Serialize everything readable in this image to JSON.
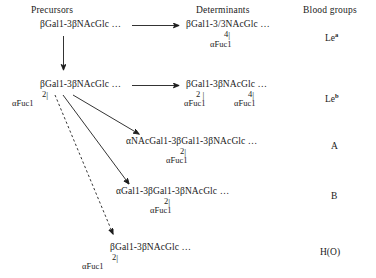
{
  "headers": {
    "precursors": "Precursors",
    "determinants": "Determinants",
    "blood_groups": "Blood groups"
  },
  "precursors": [
    {
      "id": "precursor-type1",
      "structure": "βGal1-3βNAcGlc …",
      "branches": []
    },
    {
      "id": "precursor-fucosylated",
      "structure": "βGal1-3βNAcGlc …",
      "branches": [
        {
          "bond": "2",
          "residue": "αFuc1"
        }
      ]
    }
  ],
  "determinants": [
    {
      "id": "determinant-lewis-a",
      "structure": "βGal1-3/3NAcGlc …",
      "branches": [
        {
          "bond": "4",
          "residue": "αFuc1"
        }
      ],
      "blood_group": "Le",
      "blood_group_sup": "a"
    },
    {
      "id": "determinant-lewis-b",
      "structure": "βGal1-3βNAcGlc …",
      "branches": [
        {
          "bond": "2",
          "residue": "αFuc1"
        },
        {
          "bond": "4",
          "residue": "αFuc1"
        }
      ],
      "blood_group": "Le",
      "blood_group_sup": "b"
    },
    {
      "id": "determinant-a",
      "structure": "αNAcGal1-3βGal1-3βNAcGlc …",
      "branches": [
        {
          "bond": "2",
          "residue": "αFuc1"
        }
      ],
      "blood_group": "A",
      "blood_group_sup": ""
    },
    {
      "id": "determinant-b",
      "structure": "αGal1-3βGal1-3βNAcGlc …",
      "branches": [
        {
          "bond": "2",
          "residue": "αFuc1"
        }
      ],
      "blood_group": "B",
      "blood_group_sup": ""
    },
    {
      "id": "determinant-h",
      "structure": "βGal1-3βNAcGlc …",
      "branches": [
        {
          "bond": "2",
          "residue": "αFuc1"
        }
      ],
      "blood_group": "H(O)",
      "blood_group_sup": ""
    }
  ],
  "bond_bar": "|",
  "colors": {
    "ink": "#1a1a1a",
    "stroke": "#1d1d1d",
    "background": "#ffffff"
  }
}
